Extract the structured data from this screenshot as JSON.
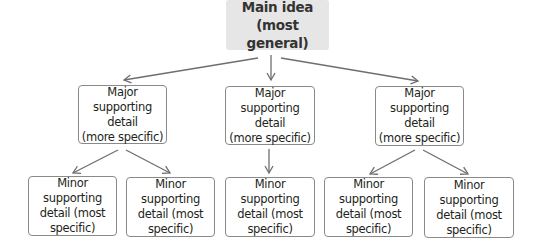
{
  "diagram": {
    "main": {
      "label": "Main idea\n(most general)",
      "fill": "#e6e6e6"
    },
    "major": [
      {
        "label": "Major supporting\ndetail\n(more specific)"
      },
      {
        "label": "Major supporting\ndetail\n(more specific)"
      },
      {
        "label": "Major supporting\ndetail\n(more specific)"
      }
    ],
    "minor": [
      {
        "label": "Minor supporting\ndetail (most\nspecific)"
      },
      {
        "label": "Minor supporting\ndetail (most\nspecific)"
      },
      {
        "label": "Minor supporting\ndetail (most\nspecific)"
      },
      {
        "label": "Minor supporting\ndetail (most\nspecific)"
      },
      {
        "label": "Minor supporting\ndetail (most\nspecific)"
      }
    ],
    "arrow_color": "#6d6e71",
    "border_color": "#8a8a8a"
  }
}
